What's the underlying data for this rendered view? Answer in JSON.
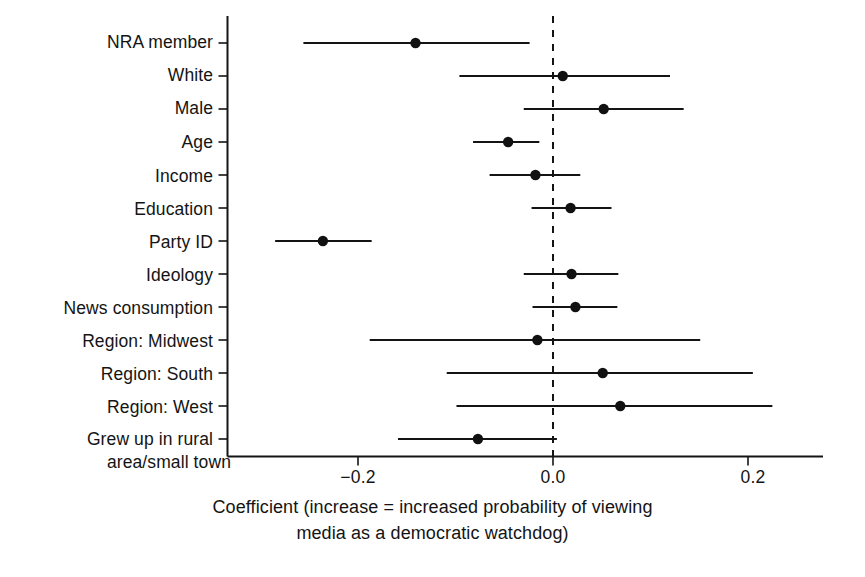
{
  "chart_data": {
    "type": "scatter",
    "subtype": "coefficient-plot-with-error-bars",
    "title": "",
    "xlabel_line1": "Coefficient (increase = increased probability of viewing",
    "xlabel_line2": "media as a democratic watchdog)",
    "ylabel": "",
    "xlim": [
      -0.334,
      0.277
    ],
    "xticks": [
      -0.2,
      0.0,
      0.2
    ],
    "xticklabels": [
      "−0.2",
      "0.0",
      "0.2"
    ],
    "grid": false,
    "legend": null,
    "reference_line": {
      "value": 0.0,
      "style": "dashed"
    },
    "categories": [
      "NRA member",
      "White",
      "Male",
      "Age",
      "Income",
      "Education",
      "Party ID",
      "Ideology",
      "News consumption",
      "Region: Midwest",
      "Region: South",
      "Region: West",
      "Grew up in rural\narea/small town"
    ],
    "points": [
      {
        "label": "NRA member",
        "estimate": -0.141,
        "ci_low": -0.256,
        "ci_high": -0.024
      },
      {
        "label": "White",
        "estimate": 0.01,
        "ci_low": -0.096,
        "ci_high": 0.12
      },
      {
        "label": "Male",
        "estimate": 0.052,
        "ci_low": -0.03,
        "ci_high": 0.134
      },
      {
        "label": "Age",
        "estimate": -0.046,
        "ci_low": -0.082,
        "ci_high": -0.014
      },
      {
        "label": "Income",
        "estimate": -0.018,
        "ci_low": -0.065,
        "ci_high": 0.028
      },
      {
        "label": "Education",
        "estimate": 0.018,
        "ci_low": -0.022,
        "ci_high": 0.06
      },
      {
        "label": "Party ID",
        "estimate": -0.236,
        "ci_low": -0.285,
        "ci_high": -0.186
      },
      {
        "label": "Ideology",
        "estimate": 0.019,
        "ci_low": -0.03,
        "ci_high": 0.067
      },
      {
        "label": "News consumption",
        "estimate": 0.023,
        "ci_low": -0.021,
        "ci_high": 0.066
      },
      {
        "label": "Region: Midwest",
        "estimate": -0.016,
        "ci_low": -0.188,
        "ci_high": 0.151
      },
      {
        "label": "Region: South",
        "estimate": 0.051,
        "ci_low": -0.109,
        "ci_high": 0.205
      },
      {
        "label": "Region: West",
        "estimate": 0.069,
        "ci_low": -0.099,
        "ci_high": 0.225
      },
      {
        "label": "Grew up in rural area/small town",
        "estimate": -0.077,
        "ci_low": -0.159,
        "ci_high": 0.004
      }
    ]
  },
  "axis": {
    "tick_values": [
      "−0.2",
      "0.0",
      "0.2"
    ],
    "caption_line1": "Coefficient (increase = increased probability of viewing",
    "caption_line2": "media as a democratic watchdog)"
  },
  "labels": {
    "nra_member": "NRA member",
    "white": "White",
    "male": "Male",
    "age": "Age",
    "income": "Income",
    "education": "Education",
    "party_id": "Party ID",
    "ideology": "Ideology",
    "news_consumption": "News consumption",
    "region_midwest": "Region: Midwest",
    "region_south": "Region: South",
    "region_west": "Region: West",
    "rural_line1": "Grew up in rural",
    "rural_line2": "area/small town"
  },
  "colors": {
    "ink": "#141414",
    "background": "#ffffff",
    "marker": "#111111"
  }
}
